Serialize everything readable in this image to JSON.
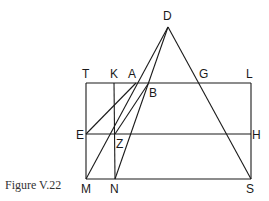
{
  "caption": "Figure V.22",
  "points": {
    "D": {
      "label": "D",
      "x": 168,
      "y": 27,
      "lx": 163,
      "ly": 20
    },
    "T": {
      "label": "T",
      "x": 86,
      "y": 83,
      "lx": 82,
      "ly": 78
    },
    "K": {
      "label": "K",
      "x": 114,
      "y": 83,
      "lx": 110,
      "ly": 78
    },
    "A": {
      "label": "A",
      "x": 136,
      "y": 83,
      "lx": 128,
      "ly": 78
    },
    "B": {
      "label": "B",
      "x": 148,
      "y": 84,
      "lx": 149,
      "ly": 97
    },
    "G": {
      "label": "G",
      "x": 200,
      "y": 83,
      "lx": 199,
      "ly": 78
    },
    "L": {
      "label": "L",
      "x": 251,
      "y": 83,
      "lx": 246,
      "ly": 78
    },
    "E": {
      "label": "E",
      "x": 86,
      "y": 134,
      "lx": 76,
      "ly": 139
    },
    "Z": {
      "label": "Z",
      "x": 115,
      "y": 134,
      "lx": 116,
      "ly": 148
    },
    "H": {
      "label": "H",
      "x": 251,
      "y": 134,
      "lx": 252,
      "ly": 139
    },
    "M": {
      "label": "M",
      "x": 86,
      "y": 179,
      "lx": 81,
      "ly": 193
    },
    "N": {
      "label": "N",
      "x": 115,
      "y": 179,
      "lx": 110,
      "ly": 193
    },
    "S": {
      "label": "S",
      "x": 251,
      "y": 179,
      "lx": 246,
      "ly": 193
    }
  },
  "segments": [
    [
      "T",
      "L"
    ],
    [
      "L",
      "S"
    ],
    [
      "S",
      "M"
    ],
    [
      "M",
      "T"
    ],
    [
      "E",
      "H"
    ],
    [
      "K",
      "N"
    ],
    [
      "D",
      "S"
    ],
    [
      "D",
      "M"
    ],
    [
      "D",
      "N"
    ],
    [
      "E",
      "A"
    ],
    [
      "Z",
      "B"
    ]
  ]
}
